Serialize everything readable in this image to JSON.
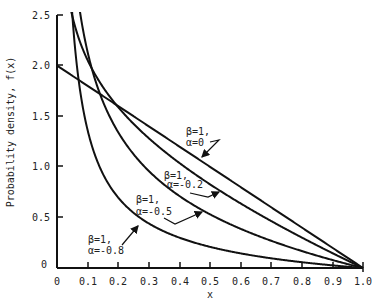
{
  "chart_data": {
    "type": "line",
    "title": "",
    "xlabel": "x",
    "ylabel": "Probability density, f(x)",
    "xlim": [
      0,
      1.0
    ],
    "ylim": [
      0,
      2.5
    ],
    "grid": false,
    "legend": "none (inline annotations with leader arrows)",
    "x_ticks": [
      "0",
      "0.1",
      "0.2",
      "0.3",
      "0.4",
      "0.5",
      "0.6",
      "0.7",
      "0.8",
      "0.9",
      "1.0"
    ],
    "y_ticks": [
      "0",
      "0.5",
      "1.0",
      "1.5",
      "2.0",
      "2.5"
    ],
    "x": [
      0.02,
      0.05,
      0.1,
      0.15,
      0.2,
      0.3,
      0.4,
      0.5,
      0.6,
      0.7,
      0.8,
      0.9,
      1.0
    ],
    "series": [
      {
        "name": "β=1, α=0",
        "values": [
          1.96,
          1.9,
          1.8,
          1.7,
          1.6,
          1.4,
          1.2,
          1.0,
          0.8,
          0.6,
          0.4,
          0.2,
          0.0
        ]
      },
      {
        "name": "β=1, α=-0.2",
        "values": [
          2.06,
          2.48,
          1.64,
          1.79,
          1.58,
          1.28,
          1.04,
          0.83,
          0.64,
          0.46,
          0.3,
          0.14,
          0.0
        ]
      },
      {
        "name": "β=1, α=-0.5",
        "values": [
          5.2,
          3.19,
          2.13,
          1.64,
          1.34,
          0.96,
          0.71,
          0.53,
          0.39,
          0.25,
          0.13,
          0.08,
          0.0
        ]
      },
      {
        "name": "β=1, α=-0.8",
        "values": [
          5.3,
          2.09,
          1.07,
          0.93,
          0.7,
          0.44,
          0.3,
          0.21,
          0.14,
          0.09,
          0.05,
          0.02,
          0.0
        ]
      }
    ],
    "annotations": [
      {
        "text": [
          "β=1,",
          "α=0"
        ]
      },
      {
        "text": [
          "β=1,",
          "α=-0.2"
        ]
      },
      {
        "text": [
          "β=1,",
          "α=-0.5"
        ]
      },
      {
        "text": [
          "β=1,",
          "α=-0.8"
        ]
      }
    ]
  },
  "labels": {
    "xlabel": "x",
    "ylabel": "Probability density, f(x)",
    "x_ticks": [
      "0",
      "0.1",
      "0.2",
      "0.3",
      "0.4",
      "0.5",
      "0.6",
      "0.7",
      "0.8",
      "0.9",
      "1.0"
    ],
    "y_ticks": [
      "0",
      "0.5",
      "1.0",
      "1.5",
      "2.0",
      "2.5"
    ],
    "annot_a0_l1": "β=1,",
    "annot_a0_l2": "α=0",
    "annot_a02_l1": "β=1,",
    "annot_a02_l2": "α=-0.2",
    "annot_a05_l1": "β=1,",
    "annot_a05_l2": "α=-0.5",
    "annot_a08_l1": "β=1,",
    "annot_a08_l2": "α=-0.8"
  }
}
